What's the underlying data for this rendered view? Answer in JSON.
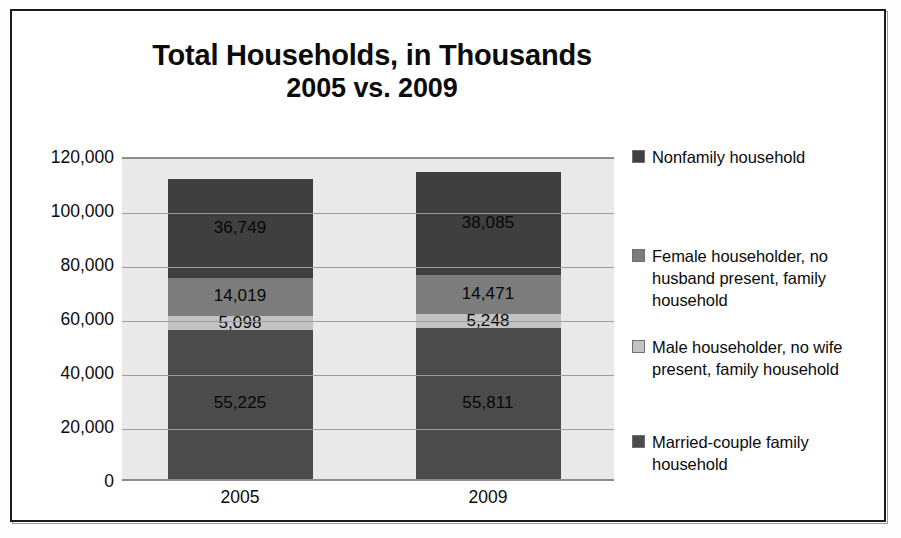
{
  "chart_data": {
    "type": "bar",
    "subtype": "stacked-column",
    "title": "Total Households, in Thousands",
    "subtitle": "2005 vs. 2009",
    "title_lines": [
      "Total Households, in Thousands",
      "2005 vs. 2009"
    ],
    "xlabel": "",
    "ylabel": "",
    "categories": [
      "2005",
      "2009"
    ],
    "ylim": [
      0,
      120000
    ],
    "ytick_step": 20000,
    "ytick_labels": [
      "120,000",
      "100,000",
      "80,000",
      "60,000",
      "40,000",
      "20,000",
      "0"
    ],
    "ytick_values": [
      120000,
      100000,
      80000,
      60000,
      40000,
      20000,
      0
    ],
    "grid": true,
    "legend_position": "right",
    "stack_order_bottom_to_top": [
      "Married-couple family household",
      "Male householder, no wife present, family household",
      "Female householder, no husband present, family household",
      "Nonfamily household"
    ],
    "series": [
      {
        "name": "Nonfamily household",
        "color": "#3f3f3f",
        "values": [
          36749,
          38085
        ],
        "labels": [
          "36,749",
          "38,085"
        ]
      },
      {
        "name": "Female householder, no husband present, family household",
        "color": "#7c7c7c",
        "values": [
          14019,
          14471
        ],
        "labels": [
          "14,019",
          "14,471"
        ]
      },
      {
        "name": "Male householder, no wife present, family household",
        "color": "#c3c3c3",
        "values": [
          5098,
          5248
        ],
        "labels": [
          "5,098",
          "5,248"
        ]
      },
      {
        "name": "Married-couple family household",
        "color": "#4b4b4b",
        "values": [
          55225,
          55811
        ],
        "labels": [
          "55,225",
          "55,811"
        ]
      }
    ],
    "totals": [
      111091,
      113615
    ],
    "plot_background": "#e9e9e9",
    "gridline_color": "#9b9b9b"
  },
  "legend": {
    "entries": [
      {
        "label": "Nonfamily household",
        "color": "#3f3f3f",
        "top": 0
      },
      {
        "label": "Female householder, no husband present, family household",
        "color": "#7c7c7c",
        "top": 99
      },
      {
        "label": "Male householder, no wife present, family household",
        "color": "#c3c3c3",
        "top": 190
      },
      {
        "label": "Married-couple family household",
        "color": "#4b4b4b",
        "top": 285
      }
    ]
  }
}
